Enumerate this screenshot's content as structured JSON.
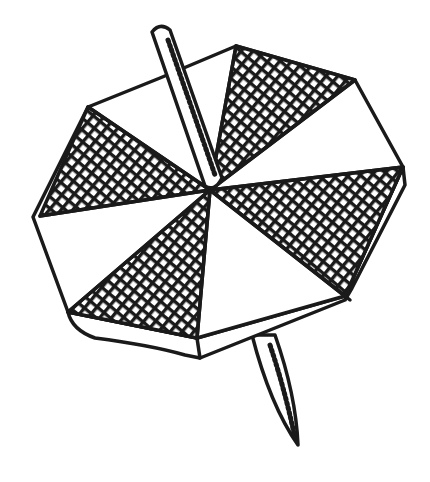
{
  "image": {
    "description": "Black and white line drawing of an octagonal spinning top with alternating crosshatched and white triangular segments, a stick through the center",
    "colors": {
      "ink": "#1a1a1a",
      "background": "#ffffff"
    },
    "segments": {
      "count": 8,
      "hatched": 4,
      "plain": 4
    }
  }
}
